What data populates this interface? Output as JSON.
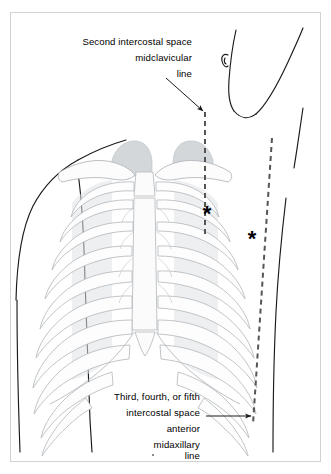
{
  "figure": {
    "background_color": "#ffffff",
    "border_color": "#d0d0d0",
    "line_color": "#1a1a1a",
    "bone_outline_color": "#b9bdc1",
    "bone_fill_color": "#fdfdfd",
    "shadow_fill_color": "#dcdfe2",
    "lung_fill_color": "#d5d8da",
    "dashed_line_color": "#555555",
    "marker_color": "#000000"
  },
  "annotations": {
    "upper": {
      "name": "second-intercostal-space-label",
      "lines": [
        "Second intercostal space",
        "midclavicular",
        "line"
      ],
      "align": "right",
      "text_right_x": 192,
      "line_start_y": 45,
      "line_height": 16,
      "leader": {
        "from_x": 167,
        "from_y": 79,
        "to_x": 204,
        "to_y": 112
      }
    },
    "lower": {
      "name": "anterior-midaxillary-line-label",
      "lines": [
        "Third, fourth, or fifth",
        "intercostal space",
        "anterior",
        "midaxillary",
        "line"
      ],
      "align": "right",
      "text_right_x": 200,
      "line_start_y": 400,
      "line_height": 16,
      "leader": {
        "from_x": 206,
        "from_y": 416,
        "to_x": 252,
        "to_y": 416
      }
    }
  },
  "landmarks": [
    {
      "name": "midclavicular-marker",
      "glyph": "*",
      "x": 207,
      "y": 215,
      "size": 19
    },
    {
      "name": "midaxillary-marker",
      "glyph": "*",
      "x": 252,
      "y": 240,
      "size": 19
    }
  ],
  "guide_lines": [
    {
      "name": "midclavicular-dashed-line",
      "x1": 205,
      "y1": 112,
      "x2": 205,
      "y2": 232,
      "dash": "5 4"
    },
    {
      "name": "anterior-midaxillary-dashed-line",
      "x1": 272,
      "y1": 138,
      "x2": 253,
      "y2": 424,
      "dash": "5 4"
    }
  ],
  "border_box": {
    "x": 10,
    "y": 12,
    "width": 311,
    "height": 450
  }
}
